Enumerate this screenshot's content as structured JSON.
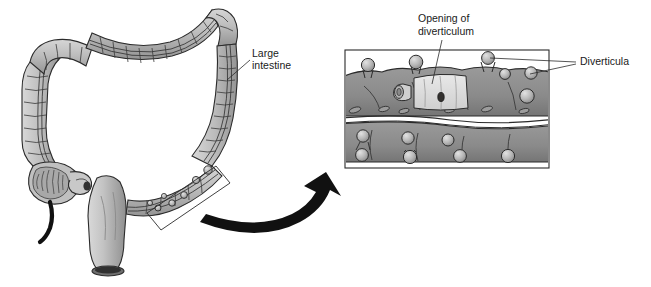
{
  "figure": {
    "background_color": "#ffffff",
    "width": 651,
    "height": 287
  },
  "palette": {
    "outline": "#2b2b2b",
    "colon_light": "#c2c2c2",
    "colon_mid": "#a8a8a8",
    "colon_shadow": "#8e8e8e",
    "detail_wall": "#8a8a8a",
    "detail_wall_dark": "#6f6f6f",
    "diverticulum_fill": "#b5b5b5",
    "mucosa_light": "#dcdcdc",
    "opening_dark": "#3a3a3a",
    "arrow_black": "#111111",
    "label_text": "#1a1a1a",
    "panel_border": "#2b2b2b"
  },
  "labels": {
    "large_intestine": {
      "line1": "Large",
      "line2": "intestine",
      "x": 252,
      "y": 57
    },
    "opening_of_diverticulum": {
      "line1": "Opening of",
      "line2": "diverticulum",
      "x": 418,
      "y": 22
    },
    "diverticula": {
      "text": "Diverticula",
      "x": 580,
      "y": 65
    }
  },
  "overview_panel": {
    "name": "large-intestine-overview",
    "parts": [
      "ascending-colon",
      "transverse-colon",
      "descending-colon",
      "sigmoid-colon",
      "rectum",
      "cecum",
      "appendix",
      "ileum",
      "taenia-coli"
    ],
    "callout_rect_label": "magnified-region-marker"
  },
  "detail_panel": {
    "name": "diverticula-detail",
    "x": 345,
    "y": 50,
    "width": 204,
    "height": 118,
    "border_color": "#2b2b2b",
    "contents": [
      "colon-wall-upper",
      "colon-wall-lower",
      "diverticula-protrusions",
      "cutaway-window",
      "diverticulum-opening"
    ]
  },
  "arrow": {
    "name": "magnification-arrow",
    "description": "curved black arrow pointing from overview to detail panel",
    "color": "#111111"
  }
}
